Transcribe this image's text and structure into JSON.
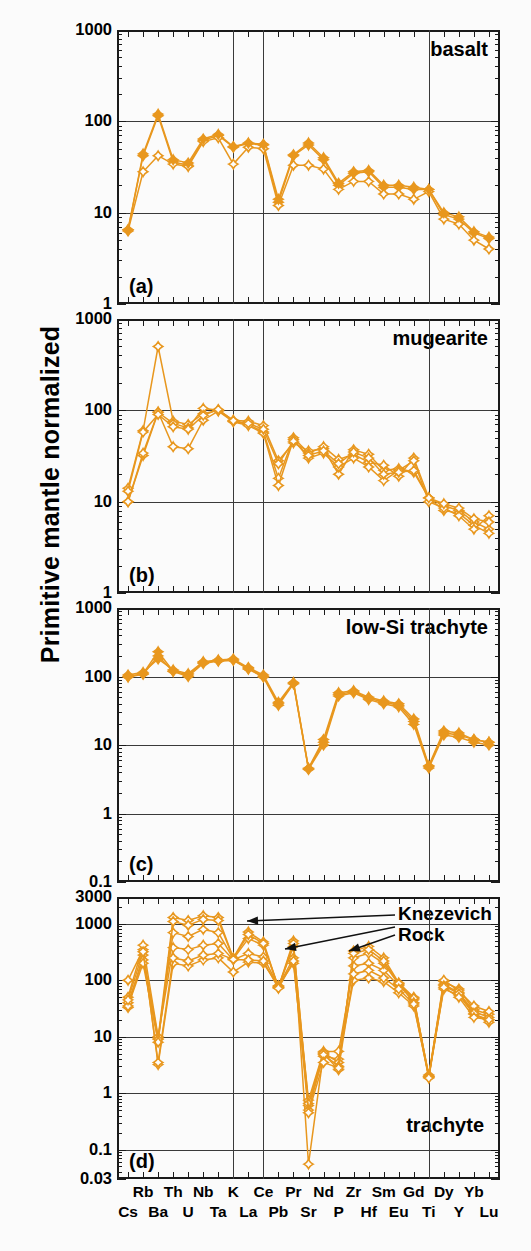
{
  "figure": {
    "ylabel": "Primitive mantle normalized",
    "marker_color": "#E8971E",
    "line_color": "#E8971E",
    "frame_color": "#1a1a1a"
  },
  "xaxis": {
    "elements": [
      "Cs",
      "Rb",
      "Ba",
      "Th",
      "U",
      "Nb",
      "Ta",
      "K",
      "La",
      "Ce",
      "Pb",
      "Pr",
      "Sr",
      "Nd",
      "P",
      "Zr",
      "Hf",
      "Sm",
      "Eu",
      "Gd",
      "Ti",
      "Dy",
      "Y",
      "Yb",
      "Lu"
    ],
    "top_row": [
      "Rb",
      "Th",
      "Nb",
      "K",
      "Ce",
      "Pr",
      "P",
      "Zr",
      "Sm",
      "Gd",
      "Dy",
      "Yb"
    ],
    "bottom_row": [
      "Cs",
      "Ba",
      "U",
      "Ta",
      "La",
      "Pb",
      "Sr",
      "Nd",
      "Hf",
      "Eu",
      "Ti",
      "Y",
      "Lu"
    ],
    "gridline_elements": [
      "K",
      "Ce",
      "Ti"
    ]
  },
  "annotation": {
    "line1": "Knezevich",
    "line2": "Rock"
  },
  "chart_data": [
    {
      "type": "line",
      "panel": "a",
      "tag": "(a)",
      "title": "basalt",
      "xlabel": "",
      "ylabel": "Primitive mantle normalized",
      "ylim": [
        1,
        1000
      ],
      "ytick_labels": [
        "1",
        "10",
        "100",
        "1000"
      ],
      "ytick_values": [
        1,
        10,
        100,
        1000
      ],
      "grid": true,
      "categories": [
        "Cs",
        "Rb",
        "Ba",
        "Th",
        "U",
        "Nb",
        "Ta",
        "K",
        "La",
        "Ce",
        "Pb",
        "Pr",
        "Sr",
        "Nd",
        "P",
        "Zr",
        "Hf",
        "Sm",
        "Eu",
        "Gd",
        "Ti",
        "Dy",
        "Y",
        "Yb",
        "Lu"
      ],
      "series": [
        {
          "name": "basalt-1",
          "marker": "filled-diamond",
          "values": [
            6.5,
            42,
            115,
            36,
            33,
            62,
            70,
            52,
            57,
            55,
            13,
            42,
            55,
            38,
            20,
            27,
            28,
            19,
            19,
            18,
            18,
            9.5,
            8.5,
            6.0,
            5.2
          ]
        },
        {
          "name": "basalt-2",
          "marker": "open-diamond",
          "values": [
            6.3,
            28,
            42,
            34,
            32,
            60,
            66,
            34,
            52,
            50,
            12,
            33,
            33,
            30,
            18,
            22,
            22,
            16,
            16,
            14,
            17,
            8.5,
            7.5,
            5.0,
            4.0
          ]
        },
        {
          "name": "basalt-3",
          "marker": "filled-diamond",
          "values": [
            6.5,
            44,
            120,
            38,
            35,
            64,
            72,
            53,
            58,
            56,
            14,
            43,
            58,
            40,
            21,
            28,
            29,
            20,
            20,
            19,
            18,
            10,
            9.0,
            6.2,
            5.4
          ]
        }
      ]
    },
    {
      "type": "line",
      "panel": "b",
      "tag": "(b)",
      "title": "mugearite",
      "xlabel": "",
      "ylabel": "Primitive mantle normalized",
      "ylim": [
        1,
        1000
      ],
      "ytick_labels": [
        "1",
        "10",
        "100",
        "1000"
      ],
      "ytick_values": [
        1,
        10,
        100,
        1000
      ],
      "grid": true,
      "categories": [
        "Cs",
        "Rb",
        "Ba",
        "Th",
        "U",
        "Nb",
        "Ta",
        "K",
        "La",
        "Ce",
        "Pb",
        "Pr",
        "Sr",
        "Nd",
        "P",
        "Zr",
        "Hf",
        "Sm",
        "Eu",
        "Gd",
        "Ti",
        "Dy",
        "Y",
        "Yb",
        "Lu"
      ],
      "series": [
        {
          "name": "mugearite-1",
          "marker": "open-diamond",
          "values": [
            14,
            60,
            500,
            76,
            70,
            92,
            100,
            78,
            76,
            68,
            28,
            44,
            36,
            38,
            20,
            37,
            33,
            22,
            23,
            21,
            11,
            9.0,
            8.0,
            6.0,
            5.0
          ]
        },
        {
          "name": "mugearite-2",
          "marker": "open-diamond",
          "values": [
            10,
            32,
            95,
            72,
            64,
            105,
            100,
            76,
            70,
            58,
            18,
            50,
            34,
            40,
            29,
            33,
            27,
            25,
            19,
            30,
            11,
            8.0,
            7.5,
            5.5,
            4.5
          ]
        },
        {
          "name": "mugearite-3",
          "marker": "open-diamond",
          "values": [
            10,
            34,
            96,
            40,
            38,
            78,
            98,
            75,
            68,
            56,
            15,
            48,
            30,
            34,
            24,
            30,
            24,
            17,
            22,
            28,
            10,
            8.5,
            7.0,
            5.0,
            7.0
          ]
        },
        {
          "name": "mugearite-4",
          "marker": "open-diamond",
          "values": [
            13,
            58,
            90,
            66,
            62,
            88,
            102,
            77,
            72,
            62,
            26,
            46,
            32,
            36,
            26,
            35,
            30,
            20,
            21,
            22,
            11,
            9.5,
            8.5,
            6.5,
            6.0
          ]
        }
      ]
    },
    {
      "type": "line",
      "panel": "c",
      "tag": "(c)",
      "title": "low-Si trachyte",
      "xlabel": "",
      "ylabel": "Primitive mantle normalized",
      "ylim": [
        0.1,
        1000
      ],
      "ytick_labels": [
        "0.1",
        "1",
        "10",
        "100",
        "1000"
      ],
      "ytick_values": [
        0.1,
        1,
        10,
        100,
        1000
      ],
      "grid": true,
      "categories": [
        "Cs",
        "Rb",
        "Ba",
        "Th",
        "U",
        "Nb",
        "Ta",
        "K",
        "La",
        "Ce",
        "Pb",
        "Pr",
        "Sr",
        "Nd",
        "P",
        "Zr",
        "Hf",
        "Sm",
        "Eu",
        "Gd",
        "Ti",
        "Dy",
        "Y",
        "Yb",
        "Lu"
      ],
      "series": [
        {
          "name": "low-Si-trachyte-1",
          "marker": "filled-diamond",
          "values": [
            100,
            110,
            230,
            120,
            105,
            160,
            170,
            175,
            130,
            100,
            40,
            80,
            4.5,
            11,
            55,
            60,
            48,
            42,
            38,
            22,
            4.8,
            15,
            14,
            12,
            11
          ]
        },
        {
          "name": "low-Si-trachyte-2",
          "marker": "filled-diamond",
          "values": [
            105,
            115,
            180,
            125,
            110,
            165,
            175,
            180,
            135,
            105,
            42,
            82,
            4.6,
            12,
            58,
            62,
            50,
            44,
            40,
            24,
            5.0,
            16,
            15,
            12,
            11
          ]
        },
        {
          "name": "low-Si-trachyte-3",
          "marker": "filled-diamond",
          "values": [
            98,
            108,
            200,
            118,
            100,
            155,
            168,
            172,
            128,
            98,
            38,
            78,
            4.4,
            10,
            52,
            58,
            46,
            40,
            36,
            20,
            4.6,
            14,
            13,
            11,
            10
          ]
        }
      ]
    },
    {
      "type": "line",
      "panel": "d",
      "tag": "(d)",
      "title": "trachyte",
      "xlabel": "",
      "ylabel": "Primitive mantle normalized",
      "ylim": [
        0.03,
        3000
      ],
      "ytick_labels": [
        "0.03",
        "0.1",
        "1",
        "10",
        "100",
        "1000",
        "3000"
      ],
      "ytick_values": [
        0.03,
        0.1,
        1,
        10,
        100,
        1000,
        3000
      ],
      "grid": true,
      "annotations": [
        {
          "text": "Knezevich Rock",
          "points_to": [
            "series-1",
            "series-2",
            "series-3"
          ]
        }
      ],
      "categories": [
        "Cs",
        "Rb",
        "Ba",
        "Th",
        "U",
        "Nb",
        "Ta",
        "K",
        "La",
        "Ce",
        "Pb",
        "Pr",
        "Sr",
        "Nd",
        "P",
        "Zr",
        "Hf",
        "Sm",
        "Eu",
        "Gd",
        "Ti",
        "Dy",
        "Y",
        "Yb",
        "Lu"
      ],
      "series": [
        {
          "name": "trachyte-1",
          "marker": "open-diamond",
          "values": [
            33,
            280,
            9.5,
            1300,
            1150,
            1400,
            1300,
            250,
            720,
            480,
            75,
            500,
            0.055,
            5.0,
            2.6,
            330,
            400,
            250,
            90,
            50,
            1.9,
            95,
            70,
            30,
            25
          ]
        },
        {
          "name": "trachyte-2",
          "marker": "open-diamond",
          "values": [
            100,
            350,
            3.2,
            200,
            180,
            230,
            250,
            140,
            210,
            200,
            80,
            200,
            0.6,
            4.5,
            4.0,
            100,
            110,
            95,
            60,
            35,
            2.0,
            70,
            55,
            25,
            20
          ]
        },
        {
          "name": "trachyte-3",
          "marker": "open-diamond",
          "values": [
            50,
            420,
            10,
            380,
            350,
            420,
            450,
            230,
            300,
            260,
            78,
            250,
            0.75,
            5.5,
            5.5,
            180,
            200,
            150,
            80,
            45,
            2.1,
            85,
            60,
            28,
            22
          ]
        },
        {
          "name": "trachyte-4",
          "marker": "open-diamond",
          "values": [
            40,
            230,
            9.0,
            700,
            600,
            800,
            700,
            240,
            550,
            420,
            76,
            400,
            0.65,
            5.2,
            3.5,
            250,
            300,
            200,
            85,
            48,
            2.0,
            100,
            65,
            35,
            28
          ]
        },
        {
          "name": "trachyte-5",
          "marker": "open-diamond",
          "values": [
            35,
            200,
            8.0,
            1100,
            950,
            1200,
            1150,
            245,
            650,
            450,
            74,
            450,
            0.5,
            4.8,
            3.0,
            300,
            350,
            220,
            88,
            40,
            1.95,
            80,
            58,
            26,
            18
          ]
        },
        {
          "name": "trachyte-6",
          "marker": "open-diamond",
          "values": [
            45,
            320,
            3.5,
            250,
            220,
            280,
            300,
            235,
            230,
            220,
            72,
            220,
            0.45,
            3.5,
            2.8,
            130,
            150,
            110,
            70,
            38,
            1.85,
            75,
            50,
            22,
            20
          ]
        }
      ]
    }
  ]
}
